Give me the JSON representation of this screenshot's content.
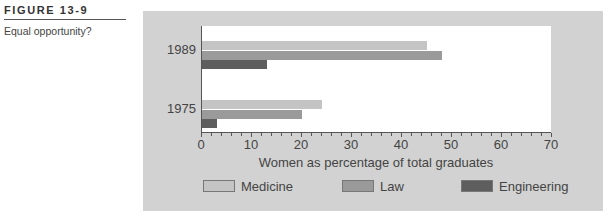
{
  "figure": {
    "label": "FIGURE 13-9",
    "caption": "Equal opportunity?"
  },
  "colors": {
    "Medicine": "#c4c4c4",
    "Law": "#9a9a9a",
    "Engineering": "#5e5e5e",
    "panel": "#d2d2d2"
  },
  "chart_data": {
    "type": "bar",
    "orientation": "horizontal",
    "title": "",
    "categories": [
      "1989",
      "1975"
    ],
    "series": [
      {
        "name": "Medicine",
        "values": [
          45,
          24
        ]
      },
      {
        "name": "Law",
        "values": [
          48,
          20
        ]
      },
      {
        "name": "Engineering",
        "values": [
          13,
          3
        ]
      }
    ],
    "xlabel": "Women as percentage of total graduates",
    "ylabel": "",
    "xlim": [
      0,
      70
    ],
    "xticks": [
      "0",
      "10",
      "20",
      "30",
      "40",
      "50",
      "60",
      "70"
    ],
    "minor_tick_step": 2,
    "grid": false,
    "legend_position": "bottom"
  }
}
